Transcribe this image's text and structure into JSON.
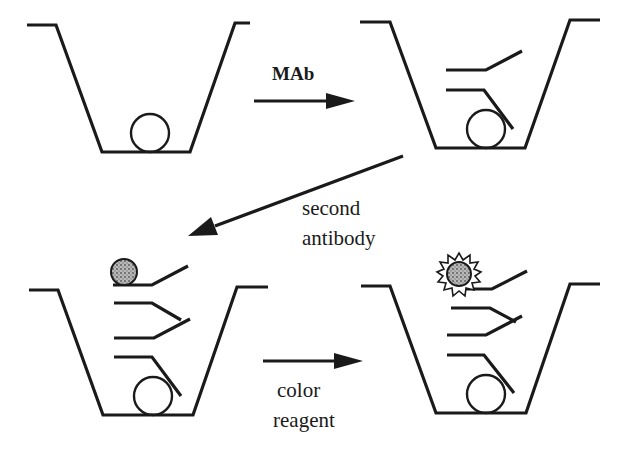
{
  "diagram": {
    "type": "process-flow",
    "colors": {
      "ink": "#1a1a1a",
      "background": "#ffffff",
      "enzyme_fill": "#9a9a9a"
    },
    "steps": [
      {
        "id": "well-1",
        "content": [
          "antigen"
        ]
      },
      {
        "id": "well-2",
        "content": [
          "antigen",
          "monoclonal-antibody"
        ]
      },
      {
        "id": "well-3",
        "content": [
          "antigen",
          "monoclonal-antibody",
          "second-antibody",
          "enzyme-label"
        ]
      },
      {
        "id": "well-4",
        "content": [
          "antigen",
          "monoclonal-antibody",
          "second-antibody",
          "enzyme-label",
          "color-signal"
        ]
      }
    ],
    "arrows": [
      {
        "from": "well-1",
        "to": "well-2",
        "label_lines": [
          "MAb"
        ]
      },
      {
        "from": "well-2",
        "to": "well-3",
        "label_lines": [
          "second",
          "antibody"
        ]
      },
      {
        "from": "well-3",
        "to": "well-4",
        "label_lines": [
          "color",
          "reagent"
        ]
      }
    ]
  },
  "labels": {
    "mab": "MAb",
    "second_antibody_line1": "second",
    "second_antibody_line2": "antibody",
    "color_reagent_line1": "color",
    "color_reagent_line2": "reagent"
  }
}
